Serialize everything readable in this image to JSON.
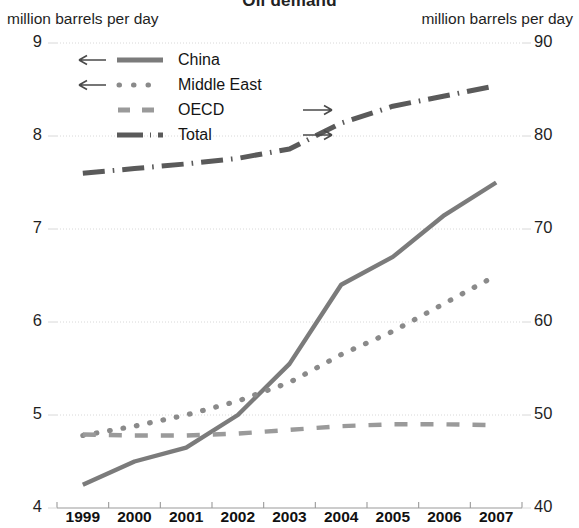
{
  "chart_data": {
    "type": "line",
    "title": "Oil demand",
    "left_axis_label": "million barrels per day",
    "right_axis_label": "million barrels per day",
    "xlabel": "",
    "categories": [
      "1999",
      "2000",
      "2001",
      "2002",
      "2003",
      "2004",
      "2005",
      "2006",
      "2007"
    ],
    "left_ylim": [
      4,
      9
    ],
    "right_ylim": [
      40,
      90
    ],
    "left_ticks": [
      "9",
      "8",
      "7",
      "6",
      "5",
      "4"
    ],
    "right_ticks": [
      "90",
      "80",
      "70",
      "60",
      "50",
      "40"
    ],
    "grid": true,
    "legend_position": "top-left-inside",
    "series": [
      {
        "name": "China",
        "axis": "left",
        "style": "solid",
        "arrow": "left",
        "values": [
          4.25,
          4.5,
          4.65,
          5.0,
          5.55,
          6.4,
          6.7,
          7.15,
          7.5
        ]
      },
      {
        "name": "Middle East",
        "axis": "left",
        "style": "dotted",
        "arrow": "left",
        "values": [
          4.78,
          4.88,
          5.0,
          5.15,
          5.35,
          5.65,
          5.9,
          6.2,
          6.5
        ]
      },
      {
        "name": "OECD",
        "axis": "right",
        "style": "dashed",
        "arrow": "right",
        "values": [
          47.9,
          47.8,
          47.8,
          48.0,
          48.4,
          48.8,
          49.0,
          49.0,
          48.9
        ]
      },
      {
        "name": "Total",
        "axis": "right",
        "style": "dashdot",
        "arrow": "right",
        "values": [
          76.0,
          76.5,
          77.0,
          77.6,
          78.6,
          81.4,
          83.2,
          84.3,
          85.4
        ]
      }
    ],
    "colors": {
      "china": "#7b7b7b",
      "middle_east": "#8a8a8a",
      "oecd": "#9a9a9a",
      "total": "#5a5a5a",
      "grid": "#d8d8d8",
      "axis": "#9a9a9a",
      "text": "#1f1f1f"
    },
    "arrow_glyphs": {
      "left": "←",
      "right": "→"
    }
  }
}
